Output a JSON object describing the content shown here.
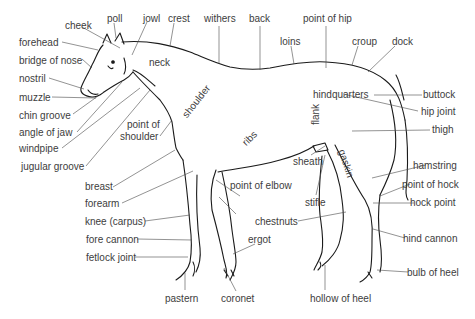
{
  "diagram": {
    "colors": {
      "outline": "#1a1a1a",
      "leader": "#4a4a4a",
      "text": "#3d3d3d",
      "background": "#ffffff"
    },
    "labels": {
      "cheek": "cheek",
      "poll": "poll",
      "jowl": "jowl",
      "crest": "crest",
      "withers": "withers",
      "back": "back",
      "point_of_hip": "point of hip",
      "loins": "loins",
      "croup": "croup",
      "dock": "dock",
      "forehead": "forehead",
      "bridge_of_nose": "bridge of nose",
      "nostril": "nostril",
      "muzzle": "muzzle",
      "chin_groove": "chin groove",
      "angle_of_jaw": "angle of jaw",
      "windpipe": "windpipe",
      "jugular_groove": "jugular groove",
      "neck": "neck",
      "shoulder": "shoulder",
      "point_of_shoulder_1": "point of",
      "point_of_shoulder_2": "shoulder",
      "ribs": "ribs",
      "flank": "flank",
      "gaskin": "gaskin",
      "hindquarters": "hindquarters",
      "buttock": "buttock",
      "hip_joint": "hip joint",
      "thigh": "thigh",
      "sheath": "sheath",
      "point_of_elbow": "point of elbow",
      "stifle": "stifle",
      "hamstring": "hamstring",
      "point_of_hock": "point of hock",
      "hock_point": "hock point",
      "breast": "breast",
      "forearm": "forearm",
      "knee": "knee (carpus)",
      "fore_cannon": "fore cannon",
      "fetlock_joint": "fetlock joint",
      "chestnuts": "chestnuts",
      "ergot": "ergot",
      "hind_cannon": "hind cannon",
      "pastern": "pastern",
      "coronet": "coronet",
      "hollow_of_heel": "hollow of heel",
      "bulb_of_heel": "bulb of heel"
    }
  }
}
